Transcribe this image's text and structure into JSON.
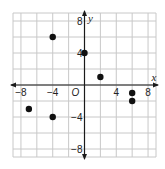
{
  "chart_data": {
    "type": "scatter",
    "title": "",
    "xlabel": "x",
    "ylabel": "y",
    "origin_label": "O",
    "xlim": [
      -9,
      9
    ],
    "ylim": [
      -9,
      9
    ],
    "grid": true,
    "grid_step": 2,
    "x_ticks": [
      {
        "value": -8,
        "label": "−8"
      },
      {
        "value": -4,
        "label": "−4"
      },
      {
        "value": 4,
        "label": "4"
      },
      {
        "value": 8,
        "label": "8"
      }
    ],
    "y_ticks": [
      {
        "value": 8,
        "label": "8"
      },
      {
        "value": 4,
        "label": "4"
      },
      {
        "value": -4,
        "label": "−4"
      },
      {
        "value": -8,
        "label": "−8"
      }
    ],
    "points": [
      {
        "x": -4,
        "y": 6
      },
      {
        "x": 0,
        "y": 4
      },
      {
        "x": 2,
        "y": 1
      },
      {
        "x": 6,
        "y": -1
      },
      {
        "x": 6,
        "y": -2
      },
      {
        "x": -7,
        "y": -3
      },
      {
        "x": -4,
        "y": -4
      }
    ],
    "point_color": "#111111",
    "grid_color": "#c8c8c8",
    "axis_color": "#1a1a1a"
  }
}
